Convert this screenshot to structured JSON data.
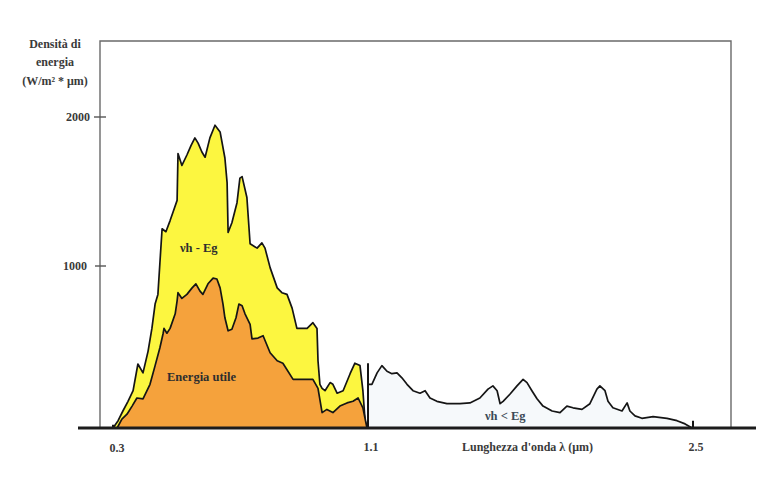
{
  "chart_data": {
    "type": "area",
    "title": "",
    "ylabel": [
      "Densità di",
      "energia",
      "(W/m² * μm)"
    ],
    "xlabel": "Lunghezza d'onda λ (μm)",
    "x_ticks": [
      "0.3",
      "1.1",
      "2.5"
    ],
    "x_tick_values": [
      0.3,
      1.1,
      2.5
    ],
    "y_ticks": [
      "1000",
      "2000"
    ],
    "y_tick_values": [
      1000,
      2000
    ],
    "xlim": [
      0.25,
      2.7
    ],
    "ylim": [
      0,
      2100
    ],
    "grid": false,
    "legend": "none (regions labelled inline)",
    "region_labels": {
      "above_gap": "νh - Eg",
      "useful": "Energia utile",
      "below_gap": "νh < Eg"
    },
    "colors": {
      "nuh_minus_eg": "#fcf640",
      "energia_utile": "#f5a23c",
      "nuh_lt_eg": "#f6f9fb"
    },
    "markers": [
      {
        "x": 0.3,
        "y_top": 20
      },
      {
        "x": 1.1,
        "y_top": 400
      },
      {
        "x": 2.5,
        "y_top": 45
      }
    ],
    "series": [
      {
        "name": "νh - Eg",
        "points": [
          [
            0.3,
            0
          ],
          [
            0.316,
            45
          ],
          [
            0.331,
            105
          ],
          [
            0.347,
            165
          ],
          [
            0.363,
            230
          ],
          [
            0.378,
            395
          ],
          [
            0.394,
            340
          ],
          [
            0.41,
            475
          ],
          [
            0.422,
            615
          ],
          [
            0.432,
            765
          ],
          [
            0.441,
            825
          ],
          [
            0.447,
            1020
          ],
          [
            0.454,
            1250
          ],
          [
            0.466,
            1230
          ],
          [
            0.479,
            1305
          ],
          [
            0.488,
            1360
          ],
          [
            0.501,
            1440
          ],
          [
            0.504,
            1755
          ],
          [
            0.516,
            1675
          ],
          [
            0.532,
            1745
          ],
          [
            0.545,
            1810
          ],
          [
            0.557,
            1860
          ],
          [
            0.567,
            1825
          ],
          [
            0.579,
            1765
          ],
          [
            0.589,
            1730
          ],
          [
            0.604,
            1860
          ],
          [
            0.62,
            1945
          ],
          [
            0.636,
            1900
          ],
          [
            0.651,
            1725
          ],
          [
            0.658,
            1560
          ],
          [
            0.661,
            1225
          ],
          [
            0.673,
            1290
          ],
          [
            0.689,
            1425
          ],
          [
            0.698,
            1590
          ],
          [
            0.705,
            1600
          ],
          [
            0.72,
            1460
          ],
          [
            0.73,
            1150
          ],
          [
            0.752,
            1120
          ],
          [
            0.767,
            1155
          ],
          [
            0.777,
            1120
          ],
          [
            0.793,
            990
          ],
          [
            0.815,
            865
          ],
          [
            0.83,
            835
          ],
          [
            0.846,
            825
          ],
          [
            0.862,
            740
          ],
          [
            0.877,
            615
          ],
          [
            0.909,
            615
          ],
          [
            0.927,
            650
          ],
          [
            0.94,
            615
          ],
          [
            0.943,
            415
          ],
          [
            0.949,
            270
          ],
          [
            0.956,
            245
          ],
          [
            0.965,
            230
          ],
          [
            0.981,
            280
          ],
          [
            0.99,
            270
          ],
          [
            1.003,
            215
          ],
          [
            1.022,
            230
          ],
          [
            1.044,
            335
          ],
          [
            1.059,
            400
          ],
          [
            1.075,
            385
          ],
          [
            1.084,
            230
          ],
          [
            1.091,
            45
          ],
          [
            1.097,
            0
          ]
        ]
      },
      {
        "name": "Energia utile",
        "points": [
          [
            0.3,
            0
          ],
          [
            0.313,
            0
          ],
          [
            0.328,
            55
          ],
          [
            0.344,
            85
          ],
          [
            0.36,
            135
          ],
          [
            0.375,
            185
          ],
          [
            0.394,
            180
          ],
          [
            0.416,
            270
          ],
          [
            0.432,
            385
          ],
          [
            0.447,
            495
          ],
          [
            0.457,
            580
          ],
          [
            0.46,
            615
          ],
          [
            0.469,
            585
          ],
          [
            0.479,
            615
          ],
          [
            0.495,
            705
          ],
          [
            0.501,
            785
          ],
          [
            0.504,
            835
          ],
          [
            0.516,
            800
          ],
          [
            0.532,
            825
          ],
          [
            0.548,
            865
          ],
          [
            0.56,
            890
          ],
          [
            0.573,
            845
          ],
          [
            0.582,
            825
          ],
          [
            0.598,
            890
          ],
          [
            0.614,
            925
          ],
          [
            0.626,
            920
          ],
          [
            0.636,
            865
          ],
          [
            0.645,
            765
          ],
          [
            0.651,
            680
          ],
          [
            0.661,
            600
          ],
          [
            0.673,
            610
          ],
          [
            0.686,
            680
          ],
          [
            0.695,
            765
          ],
          [
            0.705,
            755
          ],
          [
            0.714,
            705
          ],
          [
            0.73,
            640
          ],
          [
            0.736,
            550
          ],
          [
            0.755,
            555
          ],
          [
            0.771,
            570
          ],
          [
            0.793,
            465
          ],
          [
            0.815,
            415
          ],
          [
            0.833,
            400
          ],
          [
            0.865,
            300
          ],
          [
            0.896,
            300
          ],
          [
            0.927,
            300
          ],
          [
            0.943,
            245
          ],
          [
            0.956,
            95
          ],
          [
            0.971,
            115
          ],
          [
            0.99,
            95
          ],
          [
            1.012,
            135
          ],
          [
            1.034,
            155
          ],
          [
            1.053,
            165
          ],
          [
            1.069,
            185
          ],
          [
            1.084,
            125
          ],
          [
            1.097,
            0
          ]
        ]
      },
      {
        "name": "νh < Eg",
        "points": [
          [
            1.1,
            0
          ],
          [
            1.1,
            270
          ],
          [
            1.109,
            270
          ],
          [
            1.117,
            270
          ],
          [
            1.139,
            340
          ],
          [
            1.16,
            385
          ],
          [
            1.182,
            350
          ],
          [
            1.203,
            335
          ],
          [
            1.225,
            340
          ],
          [
            1.246,
            310
          ],
          [
            1.268,
            270
          ],
          [
            1.294,
            230
          ],
          [
            1.324,
            215
          ],
          [
            1.346,
            230
          ],
          [
            1.367,
            185
          ],
          [
            1.397,
            165
          ],
          [
            1.44,
            150
          ],
          [
            1.496,
            150
          ],
          [
            1.539,
            155
          ],
          [
            1.582,
            185
          ],
          [
            1.617,
            240
          ],
          [
            1.638,
            260
          ],
          [
            1.656,
            230
          ],
          [
            1.669,
            150
          ],
          [
            1.682,
            165
          ],
          [
            1.712,
            210
          ],
          [
            1.742,
            260
          ],
          [
            1.768,
            300
          ],
          [
            1.785,
            280
          ],
          [
            1.806,
            230
          ],
          [
            1.828,
            180
          ],
          [
            1.854,
            135
          ],
          [
            1.893,
            105
          ],
          [
            1.927,
            95
          ],
          [
            1.957,
            135
          ],
          [
            1.983,
            125
          ],
          [
            2.022,
            115
          ],
          [
            2.056,
            150
          ],
          [
            2.086,
            240
          ],
          [
            2.099,
            260
          ],
          [
            2.121,
            230
          ],
          [
            2.134,
            165
          ],
          [
            2.155,
            125
          ],
          [
            2.194,
            105
          ],
          [
            2.216,
            155
          ],
          [
            2.228,
            105
          ],
          [
            2.25,
            75
          ],
          [
            2.28,
            60
          ],
          [
            2.328,
            70
          ],
          [
            2.388,
            60
          ],
          [
            2.431,
            45
          ],
          [
            2.466,
            25
          ],
          [
            2.496,
            0
          ]
        ]
      }
    ]
  }
}
